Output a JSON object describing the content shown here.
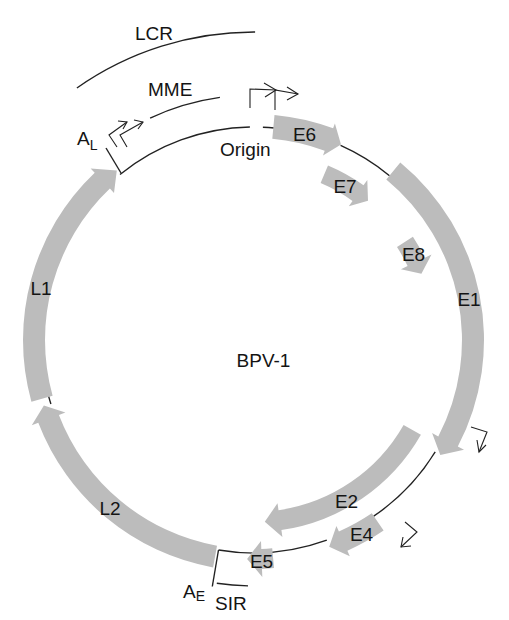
{
  "diagram": {
    "title": "BPV-1",
    "colors": {
      "gene_fill": "#bcbcbc",
      "line": "#222222",
      "background": "#ffffff"
    },
    "regions": {
      "lcr": "LCR",
      "mme": "MME",
      "origin": "Origin",
      "sir": "SIR"
    },
    "poly_a_sites": [
      {
        "label": "A",
        "subscript": "L"
      },
      {
        "label": "A",
        "subscript": "E"
      }
    ],
    "genes": [
      {
        "label": "E6",
        "strand": "clockwise"
      },
      {
        "label": "E7",
        "strand": "clockwise"
      },
      {
        "label": "E8",
        "strand": "clockwise"
      },
      {
        "label": "E1",
        "strand": "clockwise"
      },
      {
        "label": "E2",
        "strand": "clockwise"
      },
      {
        "label": "E4",
        "strand": "clockwise"
      },
      {
        "label": "E5",
        "strand": "clockwise"
      },
      {
        "label": "L2",
        "strand": "clockwise"
      },
      {
        "label": "L1",
        "strand": "clockwise"
      }
    ]
  }
}
